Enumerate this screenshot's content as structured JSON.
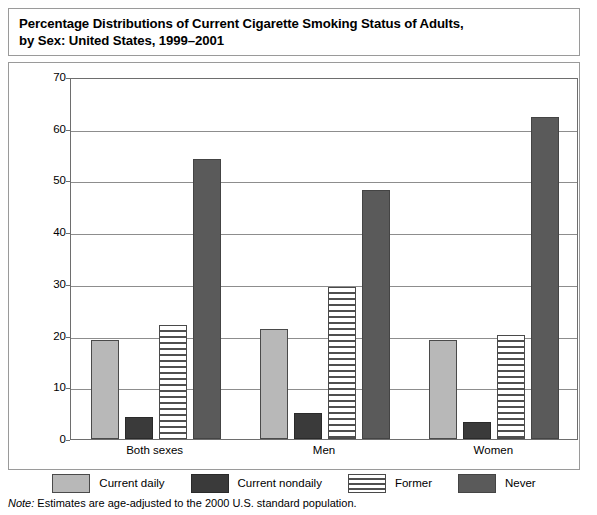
{
  "title": "Percentage Distributions of Current Cigarette Smoking Status of Adults,\nby Sex: United States, 1999–2001",
  "note": {
    "prefix": "Note:",
    "text": " Estimates are age-adjusted to the 2000 U.S. standard population."
  },
  "legend": {
    "items": [
      {
        "label": "Current daily",
        "color": "#b8b8b8",
        "pattern": "solid"
      },
      {
        "label": "Current nondaily",
        "color": "#3a3a3a",
        "pattern": "solid"
      },
      {
        "label": "Former",
        "color": "#4f4f4f",
        "pattern": "horizontal-stripes"
      },
      {
        "label": "Never",
        "color": "#5a5a5a",
        "pattern": "solid"
      }
    ]
  },
  "chart_data": {
    "type": "bar",
    "title": "Percentage Distributions of Current Cigarette Smoking Status of Adults, by Sex: United States, 1999–2001",
    "xlabel": "",
    "ylabel": "Percentage",
    "categories": [
      "Both sexes",
      "Men",
      "Women"
    ],
    "series": [
      {
        "name": "Current daily",
        "values": [
          19.2,
          21.3,
          19.2
        ],
        "color": "#b8b8b8"
      },
      {
        "name": "Current nondaily",
        "values": [
          4.2,
          5.1,
          3.3
        ],
        "color": "#3a3a3a"
      },
      {
        "name": "Former",
        "values": [
          22.1,
          29.3,
          20.2
        ],
        "color": "#4f4f4f"
      },
      {
        "name": "Never",
        "values": [
          54.2,
          48.2,
          62.2
        ],
        "color": "#5a5a5a"
      }
    ],
    "ylim": [
      0,
      70
    ],
    "yticks": [
      0,
      10,
      20,
      30,
      40,
      50,
      60,
      70
    ],
    "ytick_labels": [
      "0",
      "10",
      "20",
      "30",
      "40",
      "50",
      "60",
      "70"
    ],
    "grid": true,
    "legend_position": "bottom"
  }
}
